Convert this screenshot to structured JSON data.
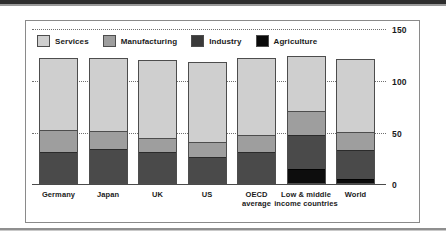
{
  "chart_data": {
    "type": "bar",
    "stacked": true,
    "title": "",
    "subtitle": "",
    "xlabel": "",
    "ylabel": "",
    "ylim": [
      0,
      150
    ],
    "yticks": [
      "0",
      "50",
      "100",
      "150"
    ],
    "ytick_values": [
      0,
      50,
      100,
      150
    ],
    "grid": true,
    "legend_position": "top-left",
    "categories": [
      "Germany",
      "Japan",
      "UK",
      "US",
      "OECD average",
      "Low & middle income countries",
      "World"
    ],
    "category_lines": [
      [
        "Germany"
      ],
      [
        "Japan"
      ],
      [
        "UK"
      ],
      [
        "US"
      ],
      [
        "OECD",
        "average"
      ],
      [
        "Low & middle",
        "income countries"
      ],
      [
        "World"
      ]
    ],
    "series": [
      {
        "name": "Agriculture",
        "color": "#0d0d0d",
        "values": [
          0,
          0,
          0,
          0,
          0,
          14,
          4
        ]
      },
      {
        "name": "Industry",
        "color": "#4a4a4a",
        "values": [
          30,
          33,
          30,
          26,
          30,
          33,
          28
        ]
      },
      {
        "name": "Manufacturing",
        "color": "#9e9e9e",
        "values": [
          22,
          18,
          14,
          14,
          17,
          24,
          18
        ]
      },
      {
        "name": "Services",
        "color": "#cfcfcf",
        "values": [
          70,
          71,
          76,
          78,
          75,
          53,
          71
        ]
      }
    ],
    "totals": [
      122,
      122,
      120,
      118,
      122,
      124,
      121
    ]
  },
  "legend": {
    "items": [
      {
        "label": "Services",
        "swatch": "services"
      },
      {
        "label": "Manufacturing",
        "swatch": "manufacturing"
      },
      {
        "label": "Industry",
        "swatch": "industry"
      },
      {
        "label": "Agriculture",
        "swatch": "agriculture"
      }
    ]
  },
  "axis": {
    "y_ticks": [
      "150",
      "100",
      "50",
      "0"
    ]
  },
  "colors": {
    "services": "#cfcfcf",
    "manufacturing": "#9e9e9e",
    "industry": "#4a4a4a",
    "agriculture": "#0d0d0d",
    "frame": "#8a8a8a",
    "gridline": "#6f6f6f",
    "text": "#1a1a1a"
  }
}
